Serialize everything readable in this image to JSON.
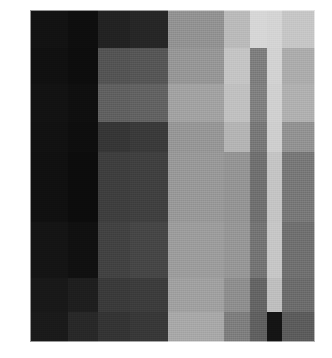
{
  "figure": {
    "background_color": "#ffffff",
    "plot": {
      "left": 30,
      "top": 10,
      "width": 285,
      "height": 332,
      "border_color": "#ffffff"
    }
  },
  "chart_data": {
    "type": "heatmap",
    "title": "",
    "subtitle": "",
    "xlabel": "",
    "ylabel": "",
    "colormap": "gray",
    "grid": false,
    "legend": null,
    "annotations": [],
    "axis_ticks_visible": false,
    "tick_labels_visible": false,
    "vmin": 0,
    "vmax": 255,
    "n_rows": 8,
    "n_cols": 9,
    "row_labels": [
      "r1",
      "r2",
      "r3",
      "r4",
      "r5",
      "r6",
      "r7",
      "r8"
    ],
    "col_labels": [
      "c1",
      "c2",
      "c3",
      "c4",
      "c5",
      "c6",
      "c7",
      "c8",
      "c9"
    ],
    "col_widths_px": [
      38,
      30,
      32,
      38,
      56,
      26,
      17,
      15,
      33
    ],
    "row_heights_px": [
      38,
      36,
      38,
      30,
      70,
      56,
      34,
      30
    ],
    "values": [
      [
        18,
        14,
        34,
        38,
        146,
        186,
        214,
        212,
        198
      ],
      [
        16,
        13,
        84,
        86,
        150,
        196,
        126,
        210,
        172
      ],
      [
        18,
        15,
        96,
        98,
        162,
        192,
        128,
        208,
        176
      ],
      [
        17,
        14,
        54,
        58,
        150,
        180,
        120,
        206,
        146
      ],
      [
        16,
        12,
        62,
        64,
        152,
        148,
        112,
        196,
        120
      ],
      [
        20,
        16,
        66,
        70,
        156,
        150,
        116,
        198,
        112
      ],
      [
        24,
        30,
        58,
        60,
        160,
        142,
        100,
        190,
        108
      ],
      [
        26,
        40,
        52,
        56,
        168,
        126,
        96,
        20,
        92
      ]
    ],
    "hex_values": [
      [
        "#121212",
        "#0e0e0e",
        "#222222",
        "#262626",
        "#929292",
        "#bababa",
        "#d6d6d6",
        "#d4d4d4",
        "#c6c6c6"
      ],
      [
        "#101010",
        "#0d0d0d",
        "#545454",
        "#565656",
        "#969696",
        "#c4c4c4",
        "#7e7e7e",
        "#d2d2d2",
        "#acacac"
      ],
      [
        "#121212",
        "#0f0f0f",
        "#606060",
        "#626262",
        "#a2a2a2",
        "#c0c0c0",
        "#808080",
        "#d0d0d0",
        "#b0b0b0"
      ],
      [
        "#111111",
        "#0e0e0e",
        "#363636",
        "#3a3a3a",
        "#969696",
        "#b4b4b4",
        "#787878",
        "#cecece",
        "#929292"
      ],
      [
        "#101010",
        "#0c0c0c",
        "#3e3e3e",
        "#404040",
        "#989898",
        "#949494",
        "#707070",
        "#c4c4c4",
        "#787878"
      ],
      [
        "#141414",
        "#101010",
        "#424242",
        "#464646",
        "#9c9c9c",
        "#969696",
        "#747474",
        "#c6c6c6",
        "#707070"
      ],
      [
        "#181818",
        "#1e1e1e",
        "#3a3a3a",
        "#3c3c3c",
        "#a0a0a0",
        "#8e8e8e",
        "#646464",
        "#bebebe",
        "#6c6c6c"
      ],
      [
        "#1a1a1a",
        "#282828",
        "#343434",
        "#383838",
        "#a8a8a8",
        "#7e7e7e",
        "#606060",
        "#141414",
        "#5c5c5c"
      ]
    ]
  }
}
